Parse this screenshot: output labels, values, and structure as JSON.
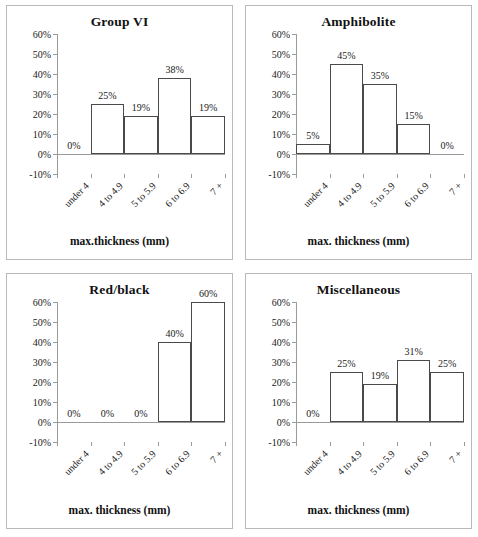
{
  "page": {
    "layout": "2x2-grid-of-bar-charts",
    "background": "#ffffff",
    "panel_border_color": "#b9b9b9",
    "bar_outline_color": "#4a4a4a",
    "axis_color": "#9a9a9a",
    "text_color": "#1a1a1a"
  },
  "axis": {
    "y_ticks": [
      "60%",
      "50%",
      "40%",
      "30%",
      "20%",
      "10%",
      "0%",
      "-10%"
    ],
    "y_values": [
      60,
      50,
      40,
      30,
      20,
      10,
      0,
      -10
    ],
    "ylim": [
      -10,
      60
    ],
    "categories": [
      "under 4",
      "4 to 4.9",
      "5 to 5.9",
      "6 to 6.9",
      "7 +"
    ]
  },
  "chart_data": [
    {
      "id": "group-vi",
      "type": "bar",
      "title": "Group VI",
      "xlabel": "max.thickness (mm)",
      "ylabel": "",
      "categories": [
        "under 4",
        "4 to 4.9",
        "5 to 5.9",
        "6 to 6.9",
        "7 +"
      ],
      "values": [
        0,
        25,
        19,
        38,
        19
      ],
      "labels": [
        "0%",
        "25%",
        "19%",
        "38%",
        "19%"
      ],
      "ylim": [
        -10,
        60
      ],
      "ytick_labels": [
        "60%",
        "50%",
        "40%",
        "30%",
        "20%",
        "10%",
        "0%",
        "-10%"
      ],
      "grid": false,
      "legend": "none"
    },
    {
      "id": "amphibolite",
      "type": "bar",
      "title": "Amphibolite",
      "xlabel": "max. thickness (mm)",
      "ylabel": "",
      "categories": [
        "under 4",
        "4 to 4.9",
        "5 to 5.9",
        "6 to 6.9",
        "7 +"
      ],
      "values": [
        5,
        45,
        35,
        15,
        0
      ],
      "labels": [
        "5%",
        "45%",
        "35%",
        "15%",
        "0%"
      ],
      "ylim": [
        -10,
        60
      ],
      "ytick_labels": [
        "60%",
        "50%",
        "40%",
        "30%",
        "20%",
        "10%",
        "0%",
        "-10%"
      ],
      "grid": false,
      "legend": "none"
    },
    {
      "id": "red-black",
      "type": "bar",
      "title": "Red/black",
      "xlabel": "max. thickness (mm)",
      "ylabel": "",
      "categories": [
        "under 4",
        "4 to 4.9",
        "5 to 5.9",
        "6 to 6.9",
        "7 +"
      ],
      "values": [
        0,
        0,
        0,
        40,
        60
      ],
      "labels": [
        "0%",
        "0%",
        "0%",
        "40%",
        "60%"
      ],
      "ylim": [
        -10,
        60
      ],
      "ytick_labels": [
        "60%",
        "50%",
        "40%",
        "30%",
        "20%",
        "10%",
        "0%",
        "-10%"
      ],
      "grid": false,
      "legend": "none"
    },
    {
      "id": "miscellaneous",
      "type": "bar",
      "title": "Miscellaneous",
      "xlabel": "max. thickness (mm)",
      "ylabel": "",
      "categories": [
        "under 4",
        "4 to 4.9",
        "5 to 5.9",
        "6 to 6.9",
        "7 +"
      ],
      "values": [
        0,
        25,
        19,
        31,
        25
      ],
      "labels": [
        "0%",
        "25%",
        "19%",
        "31%",
        "25%"
      ],
      "ylim": [
        -10,
        60
      ],
      "ytick_labels": [
        "60%",
        "50%",
        "40%",
        "30%",
        "20%",
        "10%",
        "0%",
        "-10%"
      ],
      "grid": false,
      "legend": "none"
    }
  ]
}
